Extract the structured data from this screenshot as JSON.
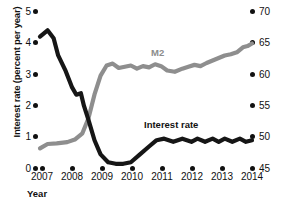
{
  "chart_data": {
    "type": "line",
    "title": "",
    "xlabel": "Year",
    "ylabel": "Interest rate (percent per year)",
    "ylabel_right": "",
    "xlim": [
      2007,
      2014
    ],
    "ylim": [
      0,
      5
    ],
    "ylim_right": [
      45,
      70
    ],
    "grid": false,
    "legend": "inline-annotations",
    "xticks": [
      "2007",
      "2008",
      "2009",
      "2010",
      "2011",
      "2012",
      "2013",
      "2014"
    ],
    "yticks_left": [
      "0",
      "1",
      "2",
      "3",
      "4",
      "5"
    ],
    "yticks_right": [
      "45",
      "50",
      "55",
      "60",
      "65",
      "70"
    ],
    "series": [
      {
        "name": "Interest rate",
        "axis": "left",
        "color": "#161616",
        "x": [
          2007.0,
          2007.25,
          2007.45,
          2007.6,
          2007.85,
          2008.05,
          2008.2,
          2008.35,
          2008.45,
          2008.6,
          2008.8,
          2009.0,
          2009.25,
          2009.5,
          2009.75,
          2010.0,
          2010.3,
          2010.6,
          2010.85,
          2011.1,
          2011.4,
          2011.7,
          2012.0,
          2012.2,
          2012.45,
          2012.7,
          2012.9,
          2013.1,
          2013.35,
          2013.6,
          2013.8,
          2014.0
        ],
        "y": [
          4.2,
          4.4,
          4.15,
          3.6,
          3.1,
          2.6,
          2.35,
          2.4,
          2.0,
          1.55,
          0.9,
          0.45,
          0.2,
          0.15,
          0.15,
          0.2,
          0.45,
          0.7,
          0.9,
          0.95,
          0.85,
          0.95,
          0.85,
          0.95,
          0.85,
          0.95,
          0.85,
          0.95,
          0.85,
          0.95,
          0.85,
          0.9
        ]
      },
      {
        "name": "M2",
        "axis": "right",
        "color": "#8e8e8e",
        "x": [
          2007.0,
          2007.25,
          2007.55,
          2007.9,
          2008.15,
          2008.4,
          2008.6,
          2008.8,
          2009.0,
          2009.2,
          2009.4,
          2009.6,
          2009.8,
          2010.0,
          2010.2,
          2010.4,
          2010.6,
          2010.8,
          2011.0,
          2011.2,
          2011.45,
          2011.7,
          2011.9,
          2012.1,
          2012.3,
          2012.5,
          2012.7,
          2012.9,
          2013.1,
          2013.3,
          2013.5,
          2013.7,
          2013.85,
          2014.0
        ],
        "y": [
          48.2,
          48.9,
          49.0,
          49.2,
          49.6,
          50.6,
          53.0,
          56.8,
          59.8,
          61.4,
          61.7,
          61.0,
          61.2,
          61.4,
          60.9,
          61.3,
          61.1,
          61.6,
          61.3,
          60.6,
          60.4,
          60.9,
          61.2,
          61.5,
          61.3,
          61.8,
          62.2,
          62.6,
          63.0,
          63.2,
          63.5,
          64.3,
          64.5,
          64.9
        ]
      }
    ],
    "annotations": [
      {
        "text": "M2",
        "x": 2011.1,
        "y_right": 63.5
      },
      {
        "text": "Interest rate",
        "x": 2012.2,
        "y_left": 1.55
      }
    ]
  },
  "axis": {
    "y_title": "Interest rate (percent per year)",
    "x_title": "Year"
  },
  "labels": {
    "m2": "M2",
    "interest_rate": "Interest rate"
  }
}
